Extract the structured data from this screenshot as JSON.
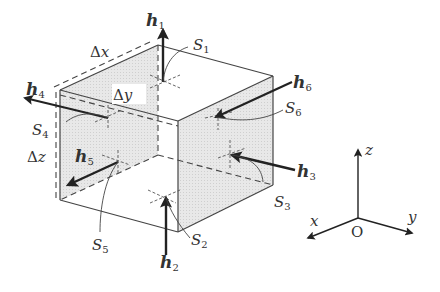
{
  "figure": {
    "colors": {
      "stroke": "#333333",
      "face_shade": "#e6e6e6",
      "background": "#ffffff"
    }
  },
  "labels": {
    "dx": "Δx",
    "dy": "Δy",
    "dz": "Δz",
    "h": "h",
    "S": "S",
    "idx1": "1",
    "idx2": "2",
    "idx3": "3",
    "idx4": "4",
    "idx5": "5",
    "idx6": "6"
  },
  "vectors": [
    {
      "name": "h1",
      "face": "S1",
      "direction": "up (+z)"
    },
    {
      "name": "h2",
      "face": "S2",
      "direction": "into bottom face (+z)"
    },
    {
      "name": "h3",
      "face": "S3",
      "direction": "into right face (-y)"
    },
    {
      "name": "h4",
      "face": "S4",
      "direction": "out of left face (-y)"
    },
    {
      "name": "h5",
      "face": "S5",
      "direction": "out of front face (+x)"
    },
    {
      "name": "h6",
      "face": "S6",
      "direction": "into back face (-x)"
    }
  ],
  "axes": {
    "x": "x",
    "y": "y",
    "z": "z",
    "origin": "O"
  }
}
